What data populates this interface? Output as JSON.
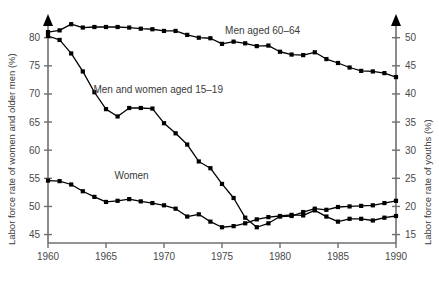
{
  "chart_data": {
    "type": "line",
    "title": "",
    "subtitle": "",
    "xlabel": "",
    "ylabel": "Labor force rate of women and older men (%)",
    "y2label": "Labor force rate of youths (%)",
    "xlim": [
      1960,
      1990
    ],
    "ylim": [
      43.5,
      83.5
    ],
    "y2lim": [
      13.5,
      53.5
    ],
    "grid": false,
    "legend_position": "inline-annotations",
    "xticks": [
      1960,
      1965,
      1970,
      1975,
      1980,
      1985,
      1990
    ],
    "xticklabels": [
      "1960",
      "1965",
      "1970",
      "1975",
      "1980",
      "1985",
      "1990"
    ],
    "yticks": [
      45,
      50,
      55,
      60,
      65,
      70,
      75,
      80
    ],
    "yticklabels": [
      "45",
      "50",
      "55",
      "60",
      "65",
      "70",
      "75",
      "80"
    ],
    "y2ticks": [
      15,
      20,
      25,
      30,
      35,
      40,
      45,
      50
    ],
    "y2ticklabels": [
      "15",
      "20",
      "25",
      "30",
      "35",
      "40",
      "45",
      "50"
    ],
    "x": [
      1960,
      1961,
      1962,
      1963,
      1964,
      1965,
      1966,
      1967,
      1968,
      1969,
      1970,
      1971,
      1972,
      1973,
      1974,
      1975,
      1976,
      1977,
      1978,
      1979,
      1980,
      1981,
      1982,
      1983,
      1984,
      1985,
      1986,
      1987,
      1988,
      1989,
      1990
    ],
    "series": [
      {
        "name": "Men aged 60-64",
        "label": "Men aged 60–64",
        "axis": "right",
        "color": "#000000",
        "marker": "square",
        "label_x": 1978.5,
        "label_y": 50.6,
        "values": [
          51.0,
          51.3,
          52.4,
          51.8,
          51.9,
          51.9,
          51.9,
          51.8,
          51.6,
          51.5,
          51.2,
          51.2,
          50.5,
          50.0,
          49.9,
          48.9,
          49.3,
          49.0,
          48.5,
          48.6,
          47.5,
          47.0,
          46.9,
          47.4,
          46.2,
          45.5,
          44.7,
          44.1,
          44.0,
          43.7,
          43.0
        ],
        "left_axis_values": [
          81.5,
          81.8,
          82.9,
          82.3,
          82.4,
          82.4,
          82.4,
          82.3,
          82.1,
          82.0,
          81.7,
          81.7,
          81.0,
          80.5,
          80.4,
          79.4,
          79.8,
          79.5,
          79.0,
          79.1,
          78.0,
          77.5,
          77.4,
          77.9,
          76.7,
          76.0,
          75.2,
          74.6,
          74.5,
          74.2,
          73.5
        ]
      },
      {
        "name": "Men and women aged 15-19",
        "label": "Men and women aged 15–19",
        "axis": "left",
        "color": "#000000",
        "marker": "square",
        "label_x": 1969.5,
        "label_y": 70.2,
        "values": [
          80.3,
          79.6,
          77.2,
          74.0,
          70.3,
          67.3,
          66.0,
          67.5,
          67.5,
          67.4,
          64.8,
          63.0,
          61.0,
          58.0,
          56.8,
          54.0,
          51.5,
          48.0,
          46.3,
          47.0,
          48.2,
          48.3,
          49.0,
          49.6,
          49.4,
          49.9,
          50.0,
          50.1,
          50.2,
          50.6,
          51.0
        ],
        "right_axis_values": [
          40.3,
          39.6,
          37.2,
          34.0,
          30.3,
          27.3,
          26.0,
          27.5,
          27.5,
          27.4,
          24.8,
          23.0,
          21.0,
          18.0,
          16.8,
          14.0,
          11.5,
          8.0,
          6.3,
          7.0,
          8.2,
          8.3,
          9.0,
          9.6,
          9.4,
          9.9,
          10.0,
          10.1,
          10.2,
          10.6,
          11.0
        ]
      },
      {
        "name": "Women",
        "label": "Women",
        "axis": "left",
        "color": "#000000",
        "marker": "square",
        "label_x": 1967.2,
        "label_y": 54.8,
        "values": [
          54.6,
          54.5,
          53.9,
          52.7,
          51.7,
          50.8,
          51.0,
          51.3,
          50.9,
          50.6,
          50.2,
          49.6,
          48.2,
          48.6,
          47.3,
          46.3,
          46.5,
          47.0,
          47.7,
          48.1,
          48.3,
          48.5,
          48.4,
          49.3,
          48.2,
          47.3,
          47.8,
          47.8,
          47.5,
          48.0,
          48.3
        ]
      }
    ]
  },
  "axes": {
    "left_title": "Labor force rate of women and older men (%)",
    "right_title": "Labor force rate of youths (%)"
  }
}
